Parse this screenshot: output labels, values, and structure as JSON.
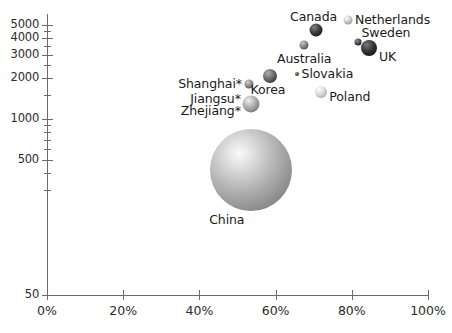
{
  "chart_data": {
    "type": "scatter",
    "title": "",
    "subtitle": "",
    "xlabel": "",
    "ylabel": "",
    "xscale": "linear",
    "yscale": "log",
    "xlim": [
      0,
      100
    ],
    "ylim": [
      50,
      6000
    ],
    "grid": false,
    "legend": null,
    "note": "Bubble chart; bubble area encodes a third magnitude variable. Asterisk (*) marks Chinese provinces/municipalities.",
    "x_tick_labels": [
      "0%",
      "20%",
      "40%",
      "60%",
      "80%",
      "100%"
    ],
    "x_tick_values": [
      0,
      20,
      40,
      60,
      80,
      100
    ],
    "y_tick_labels": [
      "5000",
      "4000",
      "3000",
      "2000",
      "1000",
      "500",
      "50"
    ],
    "y_tick_values": [
      5000,
      4000,
      3000,
      2000,
      1000,
      500,
      50
    ],
    "y_minor_tick_values": [
      4500,
      3500,
      2500,
      1500,
      900,
      800,
      700,
      600,
      400,
      300
    ],
    "points": [
      {
        "label": "Canada",
        "x": 70.5,
        "y": 4600,
        "size": 13,
        "color": "#3b3b3b",
        "label_dx": -2,
        "label_dy": -13,
        "label_anchor": "mid"
      },
      {
        "label": "Netherlands",
        "x": 79.0,
        "y": 5400,
        "size": 9,
        "color": "#c7c7c7",
        "label_dx": 7,
        "label_dy": 0,
        "label_anchor": "start"
      },
      {
        "label": "Sweden",
        "x": 81.5,
        "y": 3700,
        "size": 7,
        "color": "#4a4a4a",
        "label_dx": 4,
        "label_dy": -9,
        "label_anchor": "start"
      },
      {
        "label": "UK",
        "x": 84.5,
        "y": 3350,
        "size": 16,
        "color": "#333333",
        "label_dx": 10,
        "label_dy": 9,
        "label_anchor": "start"
      },
      {
        "label": "Australia",
        "x": 67.5,
        "y": 3550,
        "size": 9,
        "color": "#808080",
        "label_dx": 0,
        "label_dy": 14,
        "label_anchor": "mid"
      },
      {
        "label": "Slovakia",
        "x": 65.5,
        "y": 2150,
        "size": 4,
        "color": "#555555",
        "label_dx": 5,
        "label_dy": 0,
        "label_anchor": "start"
      },
      {
        "label": "Poland",
        "x": 72.0,
        "y": 1600,
        "size": 12,
        "color": "#d8d8d8",
        "label_dx": 8,
        "label_dy": 5,
        "label_anchor": "start"
      },
      {
        "label": "Korea",
        "x": 58.5,
        "y": 2100,
        "size": 14,
        "color": "#6a6a6a",
        "label_dx": -2,
        "label_dy": 14,
        "label_anchor": "mid"
      },
      {
        "label": "Shanghai*",
        "x": 53.0,
        "y": 1820,
        "size": 9,
        "color": "#8a8a8a",
        "label_dx": -7,
        "label_dy": 0,
        "label_anchor": "end"
      },
      {
        "label": "Jiangsu*",
        "x": 53.5,
        "y": 1290,
        "size": 17,
        "color": "#a8a8a8",
        "label_dx": -10,
        "label_dy": -5,
        "label_anchor": "end"
      },
      {
        "label": "Zhejiang*",
        "x": 53.5,
        "y": 1290,
        "size": 0,
        "color": "#a8a8a8",
        "label_dx": -10,
        "label_dy": 7,
        "label_anchor": "end"
      },
      {
        "label": "China",
        "x": 53.5,
        "y": 420,
        "size": 82,
        "color": "#b4b4b4",
        "label_dx": -24,
        "label_dy": 50,
        "label_anchor": "mid"
      }
    ]
  }
}
